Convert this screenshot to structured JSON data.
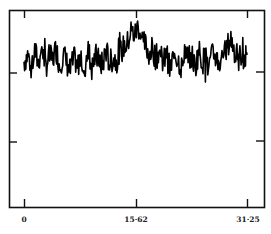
{
  "chart_data": {
    "type": "line",
    "title": "",
    "xlabel": "",
    "ylabel": "",
    "x_tick_labels": [
      "0",
      "15·62",
      "31·25"
    ],
    "x_ticks": [
      0,
      15.62,
      31.25
    ],
    "y_tick_labels": [
      "",
      ""
    ],
    "xlim": [
      -1.95,
      34.5
    ],
    "grid": false,
    "legend": null,
    "line_color": "#000000",
    "series": [
      {
        "name": "signal",
        "description": "noisy trace; flat baseline with a broad bump near x≈15 and a smaller rise near x≈29",
        "x": [
          0.0,
          0.5,
          1.0,
          1.5,
          2.0,
          2.5,
          3.0,
          3.5,
          4.0,
          4.5,
          5.0,
          5.5,
          6.0,
          6.5,
          7.0,
          7.5,
          8.0,
          8.5,
          9.0,
          9.5,
          10.0,
          10.5,
          11.0,
          11.5,
          12.0,
          12.5,
          13.0,
          13.5,
          14.0,
          14.5,
          15.0,
          15.5,
          16.0,
          16.5,
          17.0,
          17.5,
          18.0,
          18.5,
          19.0,
          19.5,
          20.0,
          20.5,
          21.0,
          21.5,
          22.0,
          22.5,
          23.0,
          23.5,
          24.0,
          24.5,
          25.0,
          25.5,
          26.0,
          26.5,
          27.0,
          27.5,
          28.0,
          28.5,
          29.0,
          29.5,
          30.0,
          30.5,
          31.0,
          31.25
        ],
        "y": [
          0.42,
          0.5,
          0.38,
          0.55,
          0.4,
          0.62,
          0.35,
          0.48,
          0.44,
          0.58,
          0.36,
          0.52,
          0.4,
          0.3,
          0.46,
          0.34,
          0.54,
          0.28,
          0.66,
          0.32,
          0.5,
          0.42,
          0.38,
          0.56,
          0.4,
          0.46,
          0.44,
          0.52,
          0.6,
          0.64,
          0.8,
          0.74,
          0.86,
          0.7,
          0.62,
          0.52,
          0.58,
          0.46,
          0.56,
          0.4,
          0.5,
          0.3,
          0.54,
          0.46,
          0.36,
          0.58,
          0.44,
          0.5,
          0.34,
          0.56,
          0.42,
          0.48,
          0.38,
          0.52,
          0.46,
          0.4,
          0.5,
          0.6,
          0.7,
          0.56,
          0.44,
          0.52,
          0.46,
          0.5
        ]
      }
    ],
    "ylim": [
      -1.0,
      1.0
    ],
    "plot_area_px": {
      "left": 9,
      "top": 10,
      "right": 264,
      "bottom": 207
    }
  },
  "axes": {
    "x_labels": [
      "0",
      "15·62",
      "31·25"
    ]
  }
}
